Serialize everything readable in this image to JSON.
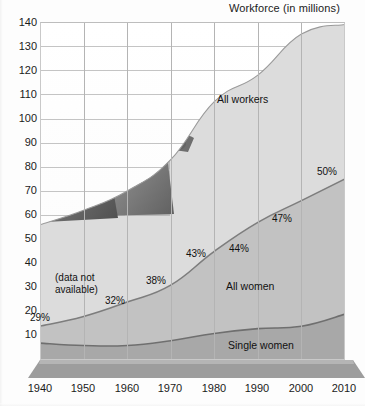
{
  "chart_data": {
    "type": "area",
    "title": "Workforce (in millions)",
    "xlabel": "",
    "ylabel": "Workforce (in millions)",
    "stacked": true,
    "grid": true,
    "legend_position": "inline-labels",
    "x": [
      1940,
      1950,
      1960,
      1970,
      1980,
      1990,
      2000,
      2010
    ],
    "xlim": [
      1940,
      2010
    ],
    "ylim": [
      0,
      140
    ],
    "yticks": [
      10,
      20,
      30,
      40,
      50,
      60,
      70,
      80,
      90,
      100,
      110,
      120,
      130,
      140
    ],
    "xticks": [
      "1940",
      "1950",
      "1960",
      "1970",
      "1980",
      "1990",
      "2000",
      "2010"
    ],
    "series": [
      {
        "name": "All workers",
        "values": [
          56,
          62,
          70,
          83,
          107,
          118,
          135,
          139
        ],
        "fill": "#dcdcdc",
        "line": "#9a9a9a"
      },
      {
        "name": "All women",
        "values": [
          14,
          18,
          24,
          31,
          45,
          57,
          66,
          75
        ],
        "fill": "#c2c2c2",
        "line": "#7d7d7d"
      },
      {
        "name": "Single women",
        "values": [
          7,
          6,
          6,
          8,
          11,
          13,
          14,
          19
        ],
        "fill": "#a8a8a8",
        "line": "#6f6f6f"
      }
    ],
    "annotations": [
      {
        "label": "29%",
        "x": 1940
      },
      {
        "label": "32%",
        "x": 1950
      },
      {
        "label": "38%",
        "x": 1960
      },
      {
        "label": "43%",
        "x": 1970
      },
      {
        "label": "44%",
        "x": 1980
      },
      {
        "label": "47%",
        "x": 1990
      },
      {
        "label": "50%",
        "x": 2000
      }
    ],
    "notes": [
      "(data not",
      "available)"
    ]
  },
  "title": {
    "text": "Workforce (in millions)"
  },
  "y_axis": {
    "ticks": [
      "140",
      "130",
      "120",
      "110",
      "100",
      "90",
      "80",
      "70",
      "60",
      "50",
      "40",
      "30",
      "20",
      "10"
    ]
  },
  "x_axis": {
    "ticks": [
      "1940",
      "1950",
      "1960",
      "1970",
      "1980",
      "1990",
      "2000",
      "2010"
    ]
  },
  "labels": {
    "all_workers": "All workers",
    "all_women": "All women",
    "single_women": "Single women"
  },
  "percent_labels": {
    "p1940": "29%",
    "p1950": "32%",
    "p1960": "38%",
    "p1970": "43%",
    "p1980": "44%",
    "p1990": "47%",
    "p2000": "50%"
  },
  "note": {
    "line1": "(data not",
    "line2": "available)"
  },
  "photo": {
    "alt": "two construction workers in hard hats"
  },
  "colors": {
    "all_workers_fill": "#dcdcdc",
    "all_women_fill": "#c2c2c2",
    "single_women_fill": "#a8a8a8",
    "grid": "#b9b9b9",
    "baseline_band": "#9d9d9d",
    "text": "#111111"
  }
}
